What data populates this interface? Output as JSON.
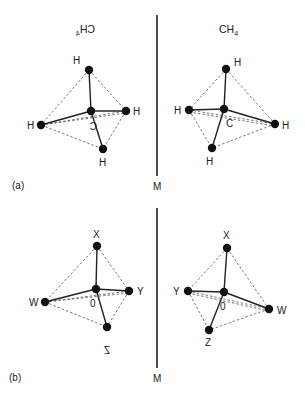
{
  "diagram": {
    "panels": [
      {
        "id": "a",
        "panel_label": "(a)",
        "mirror_label": "M",
        "left_formula": {
          "main": "CH",
          "sub": "4",
          "mirrored": true
        },
        "right_formula": {
          "main": "CH",
          "sub": "4",
          "mirrored": false
        },
        "left_molecule": {
          "center": {
            "label": "C",
            "mirrored": true,
            "x": 91,
            "y": 111
          },
          "atoms": [
            {
              "label": "H",
              "x": 89,
              "y": 70
            },
            {
              "label": "H",
              "x": 126,
              "y": 111
            },
            {
              "label": "H",
              "x": 41,
              "y": 125
            },
            {
              "label": "H",
              "x": 103,
              "y": 149
            }
          ]
        },
        "right_molecule": {
          "center": {
            "label": "C",
            "mirrored": false,
            "x": 224,
            "y": 109
          },
          "atoms": [
            {
              "label": "H",
              "x": 226,
              "y": 69
            },
            {
              "label": "H",
              "x": 189,
              "y": 110
            },
            {
              "label": "H",
              "x": 275,
              "y": 124
            },
            {
              "label": "H",
              "x": 212,
              "y": 148
            }
          ]
        }
      },
      {
        "id": "b",
        "panel_label": "(b)",
        "mirror_label": "M",
        "left_molecule": {
          "center": {
            "label": "0",
            "x": 96,
            "y": 289
          },
          "atoms": [
            {
              "label": "X",
              "x": 97,
              "y": 246
            },
            {
              "label": "Y",
              "x": 129,
              "y": 291
            },
            {
              "label": "W",
              "x": 45,
              "y": 302
            },
            {
              "label": "Z",
              "x": 107,
              "y": 327,
              "mirrored": true
            }
          ]
        },
        "right_molecule": {
          "center": {
            "label": "0",
            "x": 224,
            "y": 292
          },
          "atoms": [
            {
              "label": "X",
              "x": 227,
              "y": 248
            },
            {
              "label": "Y",
              "x": 188,
              "y": 291
            },
            {
              "label": "W",
              "x": 269,
              "y": 309
            },
            {
              "label": "Z",
              "x": 209,
              "y": 330
            }
          ]
        }
      }
    ]
  },
  "labels": {
    "a": {
      "panel": "(a)",
      "mirror": "M",
      "formula_main": "CH",
      "formula_sub": "4",
      "left_center": "C",
      "right_center": "C",
      "h": "H"
    },
    "b": {
      "panel": "(b)",
      "mirror": "M",
      "center": "0",
      "x": "X",
      "y": "Y",
      "w": "W",
      "z": "Z"
    }
  }
}
